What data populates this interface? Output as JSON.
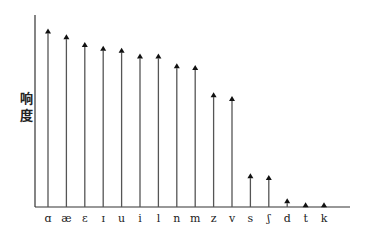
{
  "chart_data": {
    "type": "bar",
    "style": "arrow-stem",
    "title": "",
    "xlabel": "",
    "ylabel": "响度",
    "ylabel_chars": [
      "响",
      "度"
    ],
    "categories": [
      "ɑ",
      "æ",
      "ɛ",
      "ɪ",
      "u",
      "i",
      "l",
      "n",
      "m",
      "z",
      "v",
      "s",
      "ʃ",
      "d",
      "t",
      "k"
    ],
    "values": [
      92,
      89,
      85,
      83,
      82,
      79,
      79,
      74,
      73,
      59,
      57,
      17,
      16,
      4,
      2,
      2
    ],
    "ylim": [
      0,
      100
    ],
    "grid": false,
    "legend": null
  },
  "colors": {
    "axis": "#333333",
    "stem": "#555555",
    "arrow": "#111111",
    "text": "#222222"
  }
}
